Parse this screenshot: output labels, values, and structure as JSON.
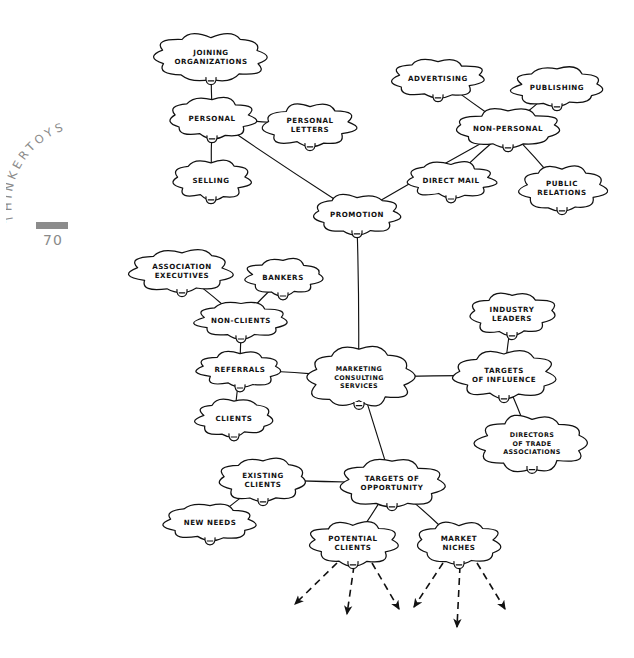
{
  "page": {
    "book_title": "THINKERTOYS",
    "page_number": "70",
    "background_color": "#ffffff",
    "ink_color": "#111111",
    "title_color": "#8a8a8a"
  },
  "diagram": {
    "type": "mind-map",
    "style": "hand-drawn cloud bubbles with connecting lines",
    "root": "MARKETING CONSULTING SERVICES",
    "nodes": [
      {
        "id": "joining-organizations",
        "label": "JOINING\nORGANIZATIONS",
        "x": 211,
        "y": 57,
        "rx": 48,
        "ry": 21
      },
      {
        "id": "personal",
        "label": "PERSONAL",
        "x": 212,
        "y": 118,
        "rx": 38,
        "ry": 18
      },
      {
        "id": "personal-letters",
        "label": "PERSONAL\nLETTERS",
        "x": 310,
        "y": 125,
        "rx": 40,
        "ry": 19
      },
      {
        "id": "selling",
        "label": "SELLING",
        "x": 211,
        "y": 180,
        "rx": 34,
        "ry": 17
      },
      {
        "id": "advertising",
        "label": "ADVERTISING",
        "x": 438,
        "y": 78,
        "rx": 40,
        "ry": 17
      },
      {
        "id": "publishing",
        "label": "PUBLISHING",
        "x": 557,
        "y": 87,
        "rx": 39,
        "ry": 17
      },
      {
        "id": "non-personal",
        "label": "NON-PERSONAL",
        "x": 508,
        "y": 128,
        "rx": 45,
        "ry": 17
      },
      {
        "id": "direct-mail",
        "label": "DIRECT MAIL",
        "x": 451,
        "y": 180,
        "rx": 40,
        "ry": 16
      },
      {
        "id": "public-relations",
        "label": "PUBLIC\nRELATIONS",
        "x": 562,
        "y": 188,
        "rx": 38,
        "ry": 20
      },
      {
        "id": "promotion",
        "label": "PROMOTION",
        "x": 357,
        "y": 214,
        "rx": 38,
        "ry": 17
      },
      {
        "id": "association-executives",
        "label": "ASSOCIATION\nEXECUTIVES",
        "x": 182,
        "y": 271,
        "rx": 44,
        "ry": 19
      },
      {
        "id": "bankers",
        "label": "BANKERS",
        "x": 283,
        "y": 277,
        "rx": 34,
        "ry": 16
      },
      {
        "id": "non-clients",
        "label": "NON-CLIENTS",
        "x": 241,
        "y": 320,
        "rx": 41,
        "ry": 16
      },
      {
        "id": "referrals",
        "label": "REFERRALS",
        "x": 240,
        "y": 369,
        "rx": 37,
        "ry": 16
      },
      {
        "id": "clients",
        "label": "CLIENTS",
        "x": 234,
        "y": 418,
        "rx": 33,
        "ry": 16
      },
      {
        "id": "marketing-consulting-services",
        "label": "MARKETING\nCONSULTING\nSERVICES",
        "x": 359,
        "y": 377,
        "rx": 47,
        "ry": 26
      },
      {
        "id": "industry-leaders",
        "label": "INDUSTRY\nLEADERS",
        "x": 512,
        "y": 314,
        "rx": 38,
        "ry": 19
      },
      {
        "id": "targets-of-influence",
        "label": "TARGETS\nOF INFLUENCE",
        "x": 504,
        "y": 375,
        "rx": 44,
        "ry": 21
      },
      {
        "id": "directors-of-trade-associations",
        "label": "DIRECTORS\nOF TRADE\nASSOCIATIONS",
        "x": 532,
        "y": 443,
        "rx": 47,
        "ry": 24
      },
      {
        "id": "existing-clients",
        "label": "EXISTING\nCLIENTS",
        "x": 263,
        "y": 480,
        "rx": 38,
        "ry": 19
      },
      {
        "id": "new-needs",
        "label": "NEW NEEDS",
        "x": 210,
        "y": 522,
        "rx": 38,
        "ry": 16
      },
      {
        "id": "targets-of-opportunity",
        "label": "TARGETS OF\nOPPORTUNITY",
        "x": 392,
        "y": 483,
        "rx": 45,
        "ry": 21
      },
      {
        "id": "potential-clients",
        "label": "POTENTIAL\nCLIENTS",
        "x": 353,
        "y": 543,
        "rx": 40,
        "ry": 19
      },
      {
        "id": "market-niches",
        "label": "MARKET\nNICHES",
        "x": 459,
        "y": 543,
        "rx": 37,
        "ry": 19
      }
    ],
    "edges": [
      {
        "from": "joining-organizations",
        "to": "personal"
      },
      {
        "from": "personal",
        "to": "personal-letters"
      },
      {
        "from": "personal",
        "to": "selling"
      },
      {
        "from": "personal",
        "to": "promotion"
      },
      {
        "from": "advertising",
        "to": "non-personal"
      },
      {
        "from": "publishing",
        "to": "non-personal"
      },
      {
        "from": "non-personal",
        "to": "direct-mail"
      },
      {
        "from": "non-personal",
        "to": "public-relations"
      },
      {
        "from": "non-personal",
        "to": "promotion"
      },
      {
        "from": "promotion",
        "to": "marketing-consulting-services"
      },
      {
        "from": "association-executives",
        "to": "non-clients"
      },
      {
        "from": "bankers",
        "to": "non-clients"
      },
      {
        "from": "non-clients",
        "to": "referrals"
      },
      {
        "from": "referrals",
        "to": "clients"
      },
      {
        "from": "referrals",
        "to": "marketing-consulting-services"
      },
      {
        "from": "marketing-consulting-services",
        "to": "targets-of-influence"
      },
      {
        "from": "industry-leaders",
        "to": "targets-of-influence"
      },
      {
        "from": "targets-of-influence",
        "to": "directors-of-trade-associations"
      },
      {
        "from": "marketing-consulting-services",
        "to": "targets-of-opportunity"
      },
      {
        "from": "existing-clients",
        "to": "targets-of-opportunity"
      },
      {
        "from": "existing-clients",
        "to": "new-needs"
      },
      {
        "from": "targets-of-opportunity",
        "to": "potential-clients"
      },
      {
        "from": "targets-of-opportunity",
        "to": "market-niches"
      }
    ],
    "dashed_arrows": [
      {
        "from": "potential-clients",
        "x1": 337,
        "y1": 563,
        "x2": 295,
        "y2": 604
      },
      {
        "from": "potential-clients",
        "x1": 354,
        "y1": 566,
        "x2": 347,
        "y2": 614
      },
      {
        "from": "potential-clients",
        "x1": 372,
        "y1": 563,
        "x2": 399,
        "y2": 609
      },
      {
        "from": "market-niches",
        "x1": 443,
        "y1": 563,
        "x2": 414,
        "y2": 607
      },
      {
        "from": "market-niches",
        "x1": 460,
        "y1": 566,
        "x2": 457,
        "y2": 627
      },
      {
        "from": "market-niches",
        "x1": 477,
        "y1": 563,
        "x2": 505,
        "y2": 609
      }
    ]
  }
}
